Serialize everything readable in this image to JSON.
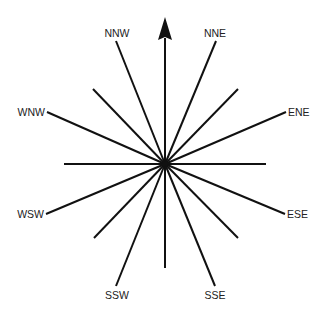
{
  "diagram": {
    "title": "",
    "type": "compass-rose",
    "colors": {
      "line": "#111111",
      "label": "#222222",
      "background": "#ffffff"
    },
    "center": {
      "x": 165,
      "y": 164
    },
    "north_arrow": {
      "direction": "N",
      "label": "",
      "apex": {
        "x": 165,
        "y": 17
      },
      "base_y": 40,
      "half_width": 7
    },
    "rays": [
      {
        "direction": "N",
        "label": "",
        "end": {
          "x": 165,
          "y": 38
        }
      },
      {
        "direction": "NNE",
        "label": "NNE",
        "end": {
          "x": 216,
          "y": 41
        }
      },
      {
        "direction": "NE",
        "label": "",
        "end": {
          "x": 238,
          "y": 89
        }
      },
      {
        "direction": "ENE",
        "label": "ENE",
        "end": {
          "x": 286,
          "y": 112
        }
      },
      {
        "direction": "E",
        "label": "",
        "end": {
          "x": 266,
          "y": 164
        }
      },
      {
        "direction": "ESE",
        "label": "ESE",
        "end": {
          "x": 285,
          "y": 214
        }
      },
      {
        "direction": "SE",
        "label": "",
        "end": {
          "x": 238,
          "y": 238
        }
      },
      {
        "direction": "SSE",
        "label": "SSE",
        "end": {
          "x": 215,
          "y": 286
        }
      },
      {
        "direction": "S",
        "label": "",
        "end": {
          "x": 165,
          "y": 268
        }
      },
      {
        "direction": "SSW",
        "label": "SSW",
        "end": {
          "x": 116,
          "y": 286
        }
      },
      {
        "direction": "SW",
        "label": "",
        "end": {
          "x": 94,
          "y": 238
        }
      },
      {
        "direction": "WSW",
        "label": "WSW",
        "end": {
          "x": 46,
          "y": 214
        }
      },
      {
        "direction": "W",
        "label": "",
        "end": {
          "x": 64,
          "y": 164
        }
      },
      {
        "direction": "WNW",
        "label": "WNW",
        "end": {
          "x": 47,
          "y": 112
        }
      },
      {
        "direction": "NW",
        "label": "",
        "end": {
          "x": 93,
          "y": 89
        }
      },
      {
        "direction": "NNW",
        "label": "NNW",
        "end": {
          "x": 116,
          "y": 41
        }
      }
    ],
    "labels": {
      "nnw": "NNW",
      "nne": "NNE",
      "wnw": "WNW",
      "ene": "ENE",
      "wsw": "WSW",
      "ese": "ESE",
      "ssw": "SSW",
      "sse": "SSE"
    }
  }
}
